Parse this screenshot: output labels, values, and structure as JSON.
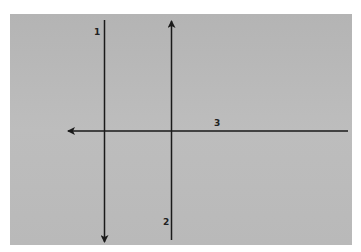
{
  "diagram": {
    "background_color": "#b8b8b8",
    "line_color": "#1a1a1a",
    "lines": [
      {
        "id": "1",
        "label": "1",
        "orientation": "vertical",
        "arrow": "down"
      },
      {
        "id": "2",
        "label": "2",
        "orientation": "vertical",
        "arrow": "up"
      },
      {
        "id": "3",
        "label": "3",
        "orientation": "horizontal",
        "arrow": "left"
      }
    ]
  }
}
